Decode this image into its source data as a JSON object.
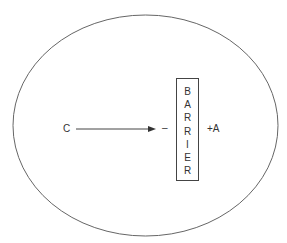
{
  "diagram": {
    "left_label": "C",
    "near_barrier_sign": "–",
    "right_label": "+A",
    "barrier_letters": [
      "B",
      "A",
      "R",
      "R",
      "I",
      "E",
      "R"
    ],
    "colors": {
      "stroke": "#555555",
      "text": "#333333",
      "background": "#ffffff"
    }
  }
}
